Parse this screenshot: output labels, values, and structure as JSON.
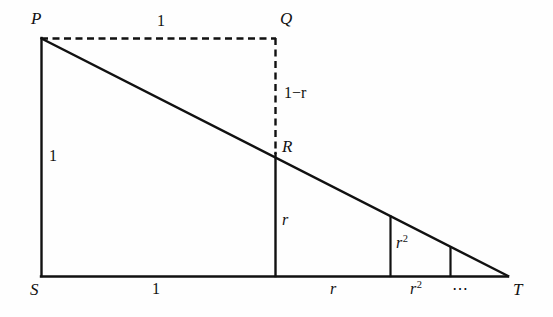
{
  "figure": {
    "background_color": "#fefefe",
    "stroke_color": "#111111",
    "vertices": [
      {
        "name": "P",
        "label": "P",
        "x": 41,
        "y": 38
      },
      {
        "name": "Q",
        "label": "Q",
        "x": 275,
        "y": 38
      },
      {
        "name": "R",
        "label": "R",
        "x": 275,
        "y": 153
      },
      {
        "name": "S",
        "label": "S",
        "x": 41,
        "y": 276
      },
      {
        "name": "T",
        "label": "T",
        "x": 508,
        "y": 276
      }
    ],
    "vertex_labels": {
      "P": "P",
      "Q": "Q",
      "R": "R",
      "S": "S",
      "T": "T"
    },
    "measurements": {
      "top_side": "1",
      "q_to_r": "1−r",
      "left_side": "1",
      "r_height": "r",
      "r2_height_base": "r",
      "r2_height_exp": "2",
      "base_first": "1",
      "base_second": "r",
      "base_third_base": "r",
      "base_third_exp": "2",
      "base_ellipsis": "⋯"
    },
    "segments": [
      {
        "name": "left-side-PS",
        "style": "solid",
        "from": "P",
        "to": "S"
      },
      {
        "name": "base-ST",
        "style": "solid",
        "from": "S",
        "to": "T"
      },
      {
        "name": "hypotenuse-PT",
        "style": "solid",
        "from": "P",
        "to": "T"
      },
      {
        "name": "top-dashed-PQ",
        "style": "dashed",
        "from": "P",
        "to": "Q"
      },
      {
        "name": "right-dashed-QR",
        "style": "dashed",
        "from": "Q",
        "to": "R"
      },
      {
        "name": "vertical-r",
        "style": "solid",
        "x": 275,
        "y1": 153,
        "y2": 276
      },
      {
        "name": "vertical-r2",
        "style": "solid",
        "x": 390,
        "y1": 217,
        "y2": 276
      },
      {
        "name": "vertical-r3",
        "style": "solid",
        "x": 450,
        "y1": 248,
        "y2": 276
      }
    ]
  }
}
